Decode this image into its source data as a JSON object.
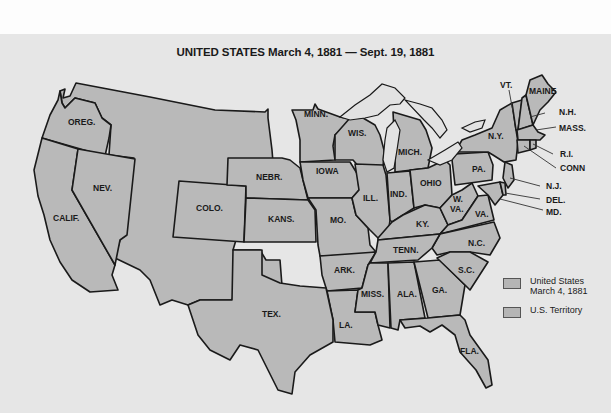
{
  "title": "UNITED STATES March 4, 1881 — Sept. 19, 1881",
  "colors": {
    "background": "#e6e6e6",
    "state_fill": "#b9b9b9",
    "territory_fill": "#b9b9b9",
    "border": "#1a1a1a",
    "lakes": "#e2e2e2"
  },
  "labels": {
    "oreg": "OREG.",
    "nev": "NEV.",
    "calif": "CALIF.",
    "colo": "COLO.",
    "nebr": "NEBR.",
    "kans": "KANS.",
    "tex": "TEX.",
    "minn": "MINN.",
    "iowa": "IOWA",
    "mo": "MO.",
    "ark": "ARK.",
    "la": "LA.",
    "wis": "WIS.",
    "ill": "ILL.",
    "mich": "MICH.",
    "ind": "IND.",
    "ohio": "OHIO",
    "ky": "KY.",
    "tenn": "TENN.",
    "miss": "MISS.",
    "ala": "ALA.",
    "ga": "GA.",
    "fla": "FLA.",
    "sc": "S.C.",
    "nc": "N.C.",
    "va": "VA.",
    "wva_1": "W.",
    "wva_2": "VA.",
    "pa": "PA.",
    "ny": "N.Y.",
    "vt": "VT.",
    "maine": "MAINE",
    "nh": "N.H.",
    "mass": "MASS.",
    "ri": "R.I.",
    "conn": "CONN",
    "nj": "N.J.",
    "del": "DEL.",
    "md": "MD."
  },
  "legend": {
    "items": [
      {
        "label_line1": "United States",
        "label_line2": "March 4, 1881"
      },
      {
        "label_line1": "U.S. Territory",
        "label_line2": ""
      }
    ]
  }
}
